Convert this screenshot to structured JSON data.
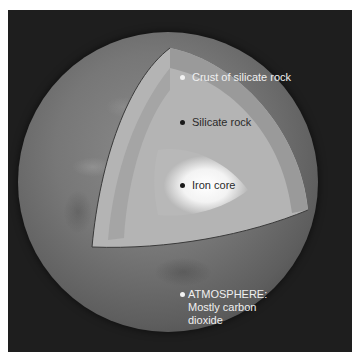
{
  "diagram": {
    "labels": [
      {
        "text": "Crust of silicate rock",
        "dot_color": "#f2f2f2",
        "text_color": "#f0f0f0"
      },
      {
        "text": "Silicate rock",
        "dot_color": "#1a1a1a",
        "text_color": "#2a2a2a"
      },
      {
        "text": "Iron core",
        "dot_color": "#1a1a1a",
        "text_color": "#2a2a2a"
      },
      {
        "text": "ATMOSPHERE:",
        "line2": "Mostly carbon",
        "line3": "dioxide",
        "dot_color": "#f2f2f2",
        "text_color": "#f0f0f0"
      }
    ]
  },
  "colors": {
    "background": "#1e1e1e",
    "crust": "#8c8c8c",
    "mantle": "#b5b5b5",
    "core": "#f5f5f5"
  }
}
